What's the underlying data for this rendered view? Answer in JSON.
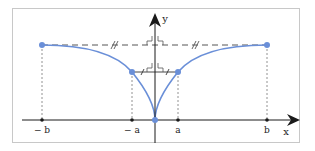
{
  "diagram": {
    "axes": {
      "x_label": "x",
      "y_label": "y"
    },
    "tick_labels": {
      "neg_b": "− b",
      "neg_a": "− a",
      "a": "a",
      "b": "b"
    },
    "colors": {
      "curve": "#6a8fd8",
      "point": "#6a8fd8",
      "axis": "#1a1a1a",
      "guide": "#555555",
      "frame": "#c8c8c8"
    },
    "points": [
      {
        "name": "neg-b-point",
        "x": "-b"
      },
      {
        "name": "neg-a-point",
        "x": "-a"
      },
      {
        "name": "origin-point",
        "x": "0"
      },
      {
        "name": "a-point",
        "x": "a"
      },
      {
        "name": "b-point",
        "x": "b"
      }
    ],
    "annotations": {
      "upper_dashed": "dashed horizontal tangent line at level of ±b points with equal-length tick marks",
      "lower_solid": "solid horizontal segment between ±a points with equal-length tick marks and right-angle marks at y-axis"
    }
  }
}
